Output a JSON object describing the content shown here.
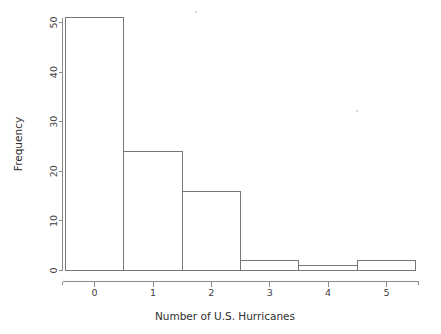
{
  "chart_data": {
    "type": "bar",
    "title": "",
    "subtitle": "",
    "xlabel": "Number of U.S. Hurricanes",
    "ylabel": "Frequency",
    "categories": [
      "0",
      "1",
      "2",
      "3",
      "4",
      "5"
    ],
    "values": [
      51,
      24,
      16,
      2,
      1,
      2
    ],
    "series": [
      {
        "name": "Frequency",
        "values": [
          51,
          24,
          16,
          2,
          1,
          2
        ]
      }
    ],
    "bins": [
      {
        "center": 0,
        "left": -0.5,
        "right": 0.5,
        "frequency": 51
      },
      {
        "center": 1,
        "left": 0.5,
        "right": 1.5,
        "frequency": 24
      },
      {
        "center": 2,
        "left": 1.5,
        "right": 2.5,
        "frequency": 16
      },
      {
        "center": 3,
        "left": 2.5,
        "right": 3.5,
        "frequency": 2
      },
      {
        "center": 4,
        "left": 3.5,
        "right": 4.5,
        "frequency": 1
      },
      {
        "center": 5,
        "left": 4.5,
        "right": 5.5,
        "frequency": 2
      }
    ],
    "xlim": [
      -0.55,
      5.55
    ],
    "ylim": [
      0,
      51
    ],
    "x_ticks": [
      "0",
      "1",
      "2",
      "3",
      "4",
      "5"
    ],
    "y_ticks": [
      "0",
      "10",
      "20",
      "30",
      "40",
      "50"
    ],
    "y_tick_values": [
      0,
      10,
      20,
      30,
      40,
      50
    ],
    "grid": false,
    "legend": false,
    "legend_position": "none",
    "bar_fill_color": "#ffffff",
    "bar_border_color": "#777777",
    "axis_color": "#8a8a8a",
    "background_color": "#ffffff",
    "text_color": "#3f3f3f"
  }
}
